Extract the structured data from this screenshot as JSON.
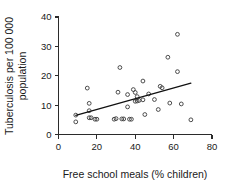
{
  "chart_data": {
    "type": "scatter",
    "title": "",
    "xlabel": "Free school meals (% children)",
    "ylabel": "Tuberculosis per 100 000 population",
    "ylabel_lines": [
      "Tuberculosis per 100 000",
      "population"
    ],
    "xlim": [
      0,
      80
    ],
    "ylim": [
      0,
      40
    ],
    "xticks": [
      0,
      20,
      40,
      60,
      80
    ],
    "yticks": [
      0,
      10,
      20,
      30,
      40
    ],
    "xtick_labels": [
      "0",
      "20",
      "40",
      "60",
      "80"
    ],
    "ytick_labels": [
      "0",
      "10",
      "20",
      "30",
      "40"
    ],
    "grid": false,
    "legend": null,
    "marker": "open-circle",
    "marker_color": "#3a3a3a",
    "line_color": "#111111",
    "points": [
      {
        "x": 9,
        "y": 6.6
      },
      {
        "x": 9,
        "y": 4.3
      },
      {
        "x": 15,
        "y": 15.8
      },
      {
        "x": 16,
        "y": 10.6
      },
      {
        "x": 16,
        "y": 8.1
      },
      {
        "x": 16,
        "y": 5.7
      },
      {
        "x": 17,
        "y": 5.7
      },
      {
        "x": 19,
        "y": 5.2
      },
      {
        "x": 20,
        "y": 5.2
      },
      {
        "x": 29,
        "y": 5.2
      },
      {
        "x": 30,
        "y": 5.4
      },
      {
        "x": 31,
        "y": 14.4
      },
      {
        "x": 32,
        "y": 22.8
      },
      {
        "x": 33,
        "y": 5.3
      },
      {
        "x": 34,
        "y": 5.3
      },
      {
        "x": 36,
        "y": 13.6
      },
      {
        "x": 36,
        "y": 9.4
      },
      {
        "x": 37,
        "y": 5.2
      },
      {
        "x": 38,
        "y": 5.2
      },
      {
        "x": 39,
        "y": 15.3
      },
      {
        "x": 40,
        "y": 14.3
      },
      {
        "x": 40,
        "y": 11.3
      },
      {
        "x": 41,
        "y": 12.9
      },
      {
        "x": 41,
        "y": 11.4
      },
      {
        "x": 42,
        "y": 11.6
      },
      {
        "x": 44,
        "y": 18.2
      },
      {
        "x": 44,
        "y": 11.8
      },
      {
        "x": 45,
        "y": 6.8
      },
      {
        "x": 47,
        "y": 13.8
      },
      {
        "x": 50,
        "y": 11.9
      },
      {
        "x": 52,
        "y": 8.5
      },
      {
        "x": 53,
        "y": 16.4
      },
      {
        "x": 54,
        "y": 15.9
      },
      {
        "x": 57,
        "y": 26.3
      },
      {
        "x": 58,
        "y": 10.7
      },
      {
        "x": 62,
        "y": 34.1
      },
      {
        "x": 62,
        "y": 21.4
      },
      {
        "x": 64,
        "y": 10.4
      },
      {
        "x": 69,
        "y": 5.0
      }
    ],
    "fit_line": {
      "label": "regression line",
      "x0": 9,
      "y0": 6.5,
      "x1": 69,
      "y1": 17.5
    }
  }
}
